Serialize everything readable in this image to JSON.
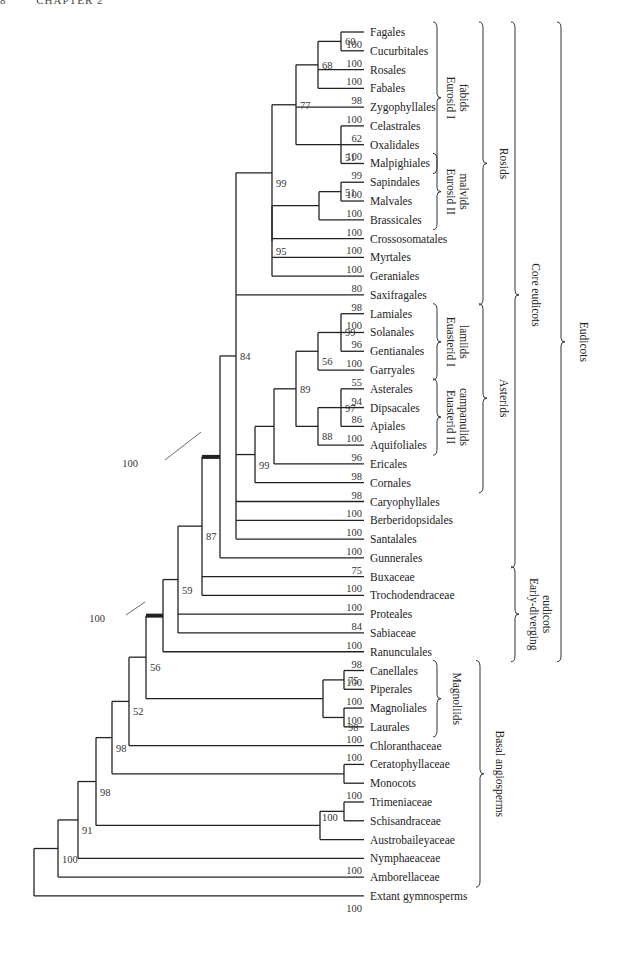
{
  "header": {
    "page": "8",
    "chapter": "CHAPTER 2"
  },
  "tree": {
    "tip_x": 364,
    "label_x": 370,
    "row0_y": 32,
    "row_step": 18.78,
    "leaves": [
      {
        "name": "Fagales",
        "support": ""
      },
      {
        "name": "Cucurbitales",
        "support": "100"
      },
      {
        "name": "Rosales",
        "support": "100"
      },
      {
        "name": "Fabales",
        "support": "100"
      },
      {
        "name": "Zygophyllales",
        "support": "98"
      },
      {
        "name": "Celastrales",
        "support": "100"
      },
      {
        "name": "Oxalidales",
        "support": "62"
      },
      {
        "name": "Malpighiales",
        "support": "100"
      },
      {
        "name": "Sapindales",
        "support": "99"
      },
      {
        "name": "Malvales",
        "support": "100"
      },
      {
        "name": "Brassicales",
        "support": "100"
      },
      {
        "name": "Crossosomatales",
        "support": "100"
      },
      {
        "name": "Myrtales",
        "support": "100"
      },
      {
        "name": "Geraniales",
        "support": "100"
      },
      {
        "name": "Saxifragales",
        "support": "80"
      },
      {
        "name": "Lamiales",
        "support": "98"
      },
      {
        "name": "Solanales",
        "support": "100"
      },
      {
        "name": "Gentianales",
        "support": "96"
      },
      {
        "name": "Garryales",
        "support": "100"
      },
      {
        "name": "Asterales",
        "support": "55"
      },
      {
        "name": "Dipsacales",
        "support": "94"
      },
      {
        "name": "Apiales",
        "support": "86"
      },
      {
        "name": "Aquifoliales",
        "support": "100"
      },
      {
        "name": "Ericales",
        "support": "96"
      },
      {
        "name": "Cornales",
        "support": "98"
      },
      {
        "name": "Caryophyllales",
        "support": "98"
      },
      {
        "name": "Berberidopsidales",
        "support": "100"
      },
      {
        "name": "Santalales",
        "support": "100"
      },
      {
        "name": "Gunnerales",
        "support": "100"
      },
      {
        "name": "Buxaceae",
        "support": "75"
      },
      {
        "name": "Trochodendraceae",
        "support": "100"
      },
      {
        "name": "Proteales",
        "support": "100"
      },
      {
        "name": "Sabiaceae",
        "support": "84"
      },
      {
        "name": "Ranunculales",
        "support": "100"
      },
      {
        "name": "Canellales",
        "support": "98"
      },
      {
        "name": "Piperales",
        "support": "100"
      },
      {
        "name": "Magnoliales",
        "support": "100"
      },
      {
        "name": "Laurales",
        "support": "100"
      },
      {
        "name": "Chloranthaceae",
        "support": "100"
      },
      {
        "name": "Ceratophyllaceae",
        "support": "100"
      },
      {
        "name": "Monocots",
        "support": ""
      },
      {
        "name": "Trimeniaceae",
        "support": "100"
      },
      {
        "name": "Schisandraceae",
        "support": ""
      },
      {
        "name": "Austrobaileyaceae",
        "support": ""
      },
      {
        "name": "Nymphaeaceae",
        "support": ""
      },
      {
        "name": "Amborellaceae",
        "support": "100"
      },
      {
        "name": "Extant gymnosperms",
        "support": ""
      }
    ],
    "bottom_support": "100",
    "nodes": [
      {
        "id": "n_fag_cuc",
        "x": 341,
        "children": [
          0,
          1
        ],
        "support": "60",
        "sx": -22,
        "sy": 4
      },
      {
        "id": "n_fab",
        "x": 318,
        "children": [
          "n_fag_cuc",
          2,
          3
        ],
        "support": "68",
        "sx": -24,
        "sy": 4
      },
      {
        "id": "n_cel",
        "x": 341,
        "children": [
          5,
          6,
          7
        ],
        "support": "51",
        "sx": -27,
        "sy": 16
      },
      {
        "id": "n_fabids",
        "x": 296,
        "children": [
          "n_fab",
          4,
          "n_cel"
        ],
        "support": "77",
        "sx": -24,
        "sy": 4
      },
      {
        "id": "n_sap_mal",
        "x": 341,
        "children": [
          8,
          9
        ],
        "support": "51",
        "sx": -22,
        "sy": 4
      },
      {
        "id": "n_malvids",
        "x": 319,
        "children": [
          "n_sap_mal",
          10
        ],
        "support": "",
        "sx": 0,
        "sy": 0
      },
      {
        "id": "n_rosid_core",
        "x": 272,
        "children": [
          "n_malvids",
          11,
          12,
          13
        ],
        "support": "95",
        "sx": -24,
        "sy": 14
      },
      {
        "id": "n_rosids",
        "x": 272,
        "children": [
          "n_fabids",
          "n_rosid_core"
        ],
        "support": "99",
        "sx": -24,
        "sy": 14
      },
      {
        "id": "n_lam",
        "x": 341,
        "children": [
          15,
          16,
          17
        ],
        "support": "99",
        "sx": -22,
        "sy": 4
      },
      {
        "id": "n_lamiids",
        "x": 318,
        "children": [
          "n_lam",
          18
        ],
        "support": "56",
        "sx": -24,
        "sy": 14
      },
      {
        "id": "n_ast",
        "x": 341,
        "children": [
          19,
          20,
          21
        ],
        "support": "97",
        "sx": -22,
        "sy": 4
      },
      {
        "id": "n_camp",
        "x": 318,
        "children": [
          "n_ast",
          22
        ],
        "support": "88",
        "sx": -24,
        "sy": 14
      },
      {
        "id": "n_euast",
        "x": 296,
        "children": [
          "n_lamiids",
          "n_camp"
        ],
        "support": "89",
        "sx": -24,
        "sy": 4
      },
      {
        "id": "n_eri",
        "x": 274,
        "children": [
          "n_euast",
          23
        ],
        "support": "",
        "sx": 0,
        "sy": 0
      },
      {
        "id": "n_asterids",
        "x": 255,
        "children": [
          "n_eri",
          24
        ],
        "support": "99",
        "sx": -20,
        "sy": 14
      },
      {
        "id": "n_core_inner",
        "x": 236,
        "children": [
          "n_rosids",
          14,
          "n_asterids",
          25,
          26,
          27
        ],
        "support": "84",
        "sx": -18,
        "sy": 4
      },
      {
        "id": "n_core",
        "x": 220,
        "children": [
          "n_core_inner",
          28
        ],
        "support": "",
        "sx": 0,
        "sy": 0,
        "thick": true
      },
      {
        "id": "n_bux",
        "x": 202,
        "children": [
          "n_core",
          29,
          30
        ],
        "support": "87",
        "sx": -18,
        "sy": 14
      },
      {
        "id": "n_prot",
        "x": 178,
        "children": [
          "n_bux",
          31,
          32
        ],
        "support": "59",
        "sx": -18,
        "sy": 14
      },
      {
        "id": "n_eudicots",
        "x": 163,
        "children": [
          "n_prot",
          33
        ],
        "support": "",
        "sx": 0,
        "sy": 0,
        "thick": true
      },
      {
        "id": "n_can",
        "x": 344,
        "children": [
          34,
          35
        ],
        "support": "75",
        "sx": -16,
        "sy": 4
      },
      {
        "id": "n_mag",
        "x": 344,
        "children": [
          36,
          37
        ],
        "support": "98",
        "sx": -16,
        "sy": 14
      },
      {
        "id": "n_magnoliids",
        "x": 323,
        "children": [
          "n_can",
          "n_mag"
        ],
        "support": "",
        "sx": 0,
        "sy": 0
      },
      {
        "id": "n_56",
        "x": 146,
        "children": [
          "n_eudicots",
          "n_magnoliids"
        ],
        "support": "56",
        "sx": -16,
        "sy": 14
      },
      {
        "id": "n_52",
        "x": 129,
        "children": [
          "n_56",
          38
        ],
        "support": "52",
        "sx": -16,
        "sy": 14
      },
      {
        "id": "n_cer",
        "x": 344,
        "children": [
          39,
          40
        ],
        "support": "",
        "sx": 0,
        "sy": 0
      },
      {
        "id": "n_98a",
        "x": 112,
        "children": [
          "n_52",
          "n_cer"
        ],
        "support": "98",
        "sx": -16,
        "sy": 14
      },
      {
        "id": "n_tri",
        "x": 344,
        "children": [
          41,
          42
        ],
        "support": "",
        "sx": 0,
        "sy": 0
      },
      {
        "id": "n_aus",
        "x": 320,
        "children": [
          "n_tri",
          43
        ],
        "support": "100",
        "sx": 2,
        "sy": -4
      },
      {
        "id": "n_98b",
        "x": 96,
        "children": [
          "n_98a",
          "n_aus"
        ],
        "support": "98",
        "sx": -16,
        "sy": 14
      },
      {
        "id": "n_91",
        "x": 78,
        "children": [
          "n_98b",
          44
        ],
        "support": "91",
        "sx": -18,
        "sy": 14
      },
      {
        "id": "n_100root",
        "x": 58,
        "children": [
          "n_91",
          45
        ],
        "support": "100",
        "sx": -24,
        "sy": 14
      },
      {
        "id": "n_root",
        "x": 34,
        "children": [
          "n_100root",
          46
        ],
        "support": "",
        "sx": 0,
        "sy": 0
      }
    ],
    "branch_labels": [
      {
        "text": "100",
        "x": 266,
        "y": 221,
        "node": "n_fabids_branch"
      },
      {
        "text": "57",
        "x": 235,
        "y": 786
      },
      {
        "text": "78",
        "x": 236,
        "y": 713
      },
      {
        "text": "100",
        "x": 280,
        "y": 833
      }
    ],
    "thick_callouts": [
      {
        "text": "100",
        "tx": 138,
        "ty": 467,
        "lx1": 165,
        "ly1": 460,
        "lx2": 201,
        "ly2": 432
      },
      {
        "text": "100",
        "tx": 105,
        "ty": 622,
        "lx1": 126,
        "ly1": 615,
        "lx2": 145,
        "ly2": 602
      }
    ]
  },
  "clades": [
    {
      "label": "Eurosid I fabids",
      "lines": [
        "Eurosid I",
        "fabids"
      ],
      "x": 437,
      "from": 0,
      "to": 7,
      "tx": 457
    },
    {
      "label": "Eurosid II malvids",
      "lines": [
        "Eurosid II",
        "malvids"
      ],
      "x": 437,
      "from": 7,
      "to": 10,
      "tx": 457
    },
    {
      "label": "Rosids",
      "lines": [
        "Rosids"
      ],
      "x": 483,
      "from": 0,
      "to": 14,
      "tx": 504
    },
    {
      "label": "Euasterid I lamiids",
      "lines": [
        "Euasterid I",
        "lamiids"
      ],
      "x": 437,
      "from": 15,
      "to": 18,
      "tx": 457
    },
    {
      "label": "Euasterid II campanulids",
      "lines": [
        "Euasterid II",
        "campanulids"
      ],
      "x": 437,
      "from": 19,
      "to": 22,
      "tx": 457
    },
    {
      "label": "Asterids",
      "lines": [
        "Asterids"
      ],
      "x": 483,
      "from": 15,
      "to": 24,
      "tx": 504
    },
    {
      "label": "Core eudicots",
      "lines": [
        "Core eudicots"
      ],
      "x": 515,
      "from": 0,
      "to": 28,
      "tx": 536
    },
    {
      "label": "Early-diverging eudicots",
      "lines": [
        "Early-diverging",
        "eudicots"
      ],
      "x": 515,
      "from": 29,
      "to": 33,
      "tx": 540
    },
    {
      "label": "Eudicots",
      "lines": [
        "Eudicots"
      ],
      "x": 561,
      "from": 0,
      "to": 33,
      "tx": 584
    },
    {
      "label": "Magnoliids",
      "lines": [
        "Magnoliids"
      ],
      "x": 437,
      "from": 34,
      "to": 37,
      "tx": 457
    },
    {
      "label": "Basal angiosperms",
      "lines": [
        "Basal angiosperms"
      ],
      "x": 480,
      "from": 34,
      "to": 45,
      "tx": 500
    }
  ]
}
